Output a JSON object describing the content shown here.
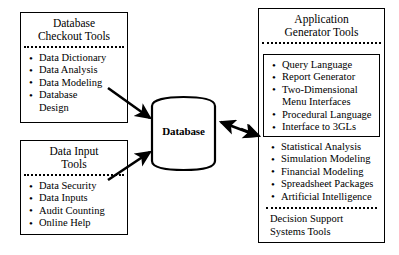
{
  "diagram": {
    "title_not_shown": "",
    "background": "#ffffff",
    "line_color": "#000000"
  },
  "left_top_box": {
    "name": "database-checkout-tools",
    "title": "Database\nCheckout Tools",
    "items": [
      {
        "text": "Data Dictionary",
        "bulleted": true
      },
      {
        "text": "Data Analysis",
        "bulleted": true
      },
      {
        "text": "Data Modeling",
        "bulleted": true
      },
      {
        "text": "Database",
        "bulleted": true
      },
      {
        "text": "Design",
        "bulleted": false
      }
    ]
  },
  "left_bottom_box": {
    "name": "data-input-tools",
    "title": "Data Input\nTools",
    "items": [
      {
        "text": "Data Security",
        "bulleted": true
      },
      {
        "text": "Data Inputs",
        "bulleted": true
      },
      {
        "text": "Audit Counting",
        "bulleted": true
      },
      {
        "text": "Online Help",
        "bulleted": true
      }
    ]
  },
  "center": {
    "name": "database-cylinder",
    "label": "Database"
  },
  "right_box": {
    "name": "application-generator-tools",
    "title": "Application\nGenerator Tools",
    "inner_items": [
      {
        "text": "Query Language",
        "bulleted": true
      },
      {
        "text": "Report Generator",
        "bulleted": true
      },
      {
        "text": "Two-Dimensional",
        "bulleted": true
      },
      {
        "text": "Menu Interfaces",
        "bulleted": false
      },
      {
        "text": "Procedural Language",
        "bulleted": true
      },
      {
        "text": "Interface to 3GLs",
        "bulleted": true
      }
    ],
    "lower_items": [
      {
        "text": "Statistical Analysis",
        "bulleted": true
      },
      {
        "text": "Simulation Modeling",
        "bulleted": true
      },
      {
        "text": "Financial Modeling",
        "bulleted": true
      },
      {
        "text": "Spreadsheet Packages",
        "bulleted": true
      },
      {
        "text": "Artificial Intelligence",
        "bulleted": true
      }
    ],
    "footer": "Decision Support\nSystems Tools"
  },
  "connectors": [
    {
      "name": "arrow-checkout-to-database",
      "direction": "one-way"
    },
    {
      "name": "arrow-input-to-database",
      "direction": "one-way"
    },
    {
      "name": "arrow-database-to-appgen",
      "direction": "two-way"
    }
  ]
}
